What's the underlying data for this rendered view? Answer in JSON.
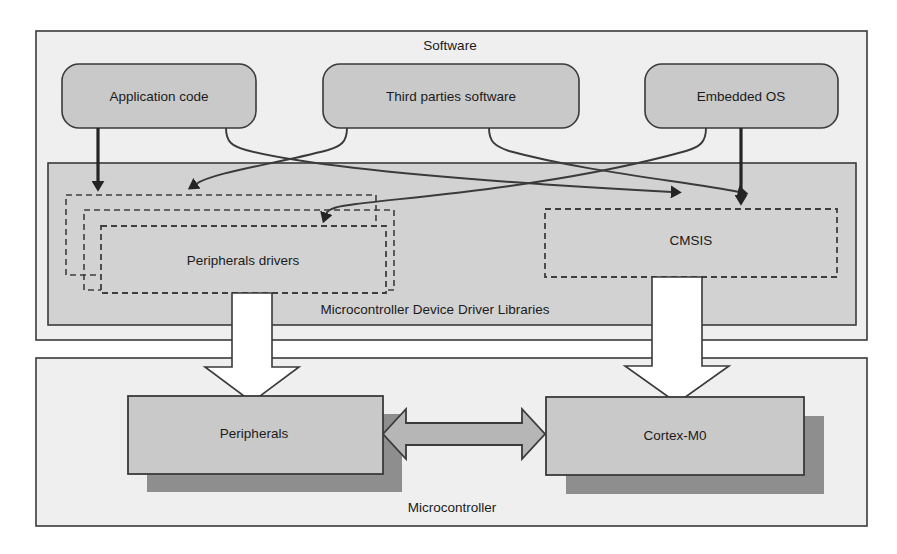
{
  "diagram": {
    "layers": {
      "software": {
        "label": "Software"
      },
      "mddl": {
        "label": "Microcontroller Device Driver Libraries"
      },
      "microcontroller": {
        "label": "Microcontroller"
      }
    },
    "software_blocks": [
      {
        "id": "application-code",
        "label": "Application code"
      },
      {
        "id": "third-parties-software",
        "label": "Third parties software"
      },
      {
        "id": "embedded-os",
        "label": "Embedded OS"
      }
    ],
    "driver_blocks": [
      {
        "id": "peripherals-drivers",
        "label": "Peripherals drivers"
      },
      {
        "id": "cmsis",
        "label": "CMSIS"
      }
    ],
    "hardware_blocks": [
      {
        "id": "peripherals",
        "label": "Peripherals"
      },
      {
        "id": "cortex-m0",
        "label": "Cortex-M0"
      }
    ],
    "connections": [
      {
        "from": "application-code",
        "to": "peripherals-drivers",
        "style": "straight-arrow"
      },
      {
        "from": "application-code",
        "to": "cmsis",
        "style": "curved-arrow"
      },
      {
        "from": "third-parties-software",
        "to": "peripherals-drivers",
        "style": "curved-arrow"
      },
      {
        "from": "third-parties-software",
        "to": "cmsis",
        "style": "curved-arrow"
      },
      {
        "from": "embedded-os",
        "to": "peripherals-drivers",
        "style": "curved-arrow"
      },
      {
        "from": "embedded-os",
        "to": "cmsis",
        "style": "straight-arrow"
      },
      {
        "from": "peripherals-drivers",
        "to": "peripherals",
        "style": "block-arrow"
      },
      {
        "from": "cmsis",
        "to": "cortex-m0",
        "style": "block-arrow"
      },
      {
        "from": "peripherals",
        "to": "cortex-m0",
        "style": "double-block-arrow"
      }
    ],
    "colors": {
      "outline": "#3a3a3a",
      "page_background": "#ffffff",
      "software_panel_fill": "#efefef",
      "mddl_panel_fill": "#d2d2d2",
      "rounded_block_fill": "#c9c9c9",
      "hardware_block_fill": "#c9c9c9",
      "hardware_shadow": "#8e8e8e",
      "double_arrow_fill": "#b6b6b6",
      "block_arrow_fill": "#ffffff",
      "text": "#1b1b1b"
    }
  }
}
